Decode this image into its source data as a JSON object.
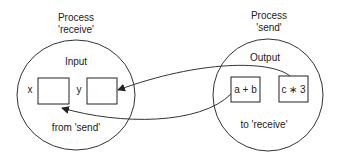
{
  "receive": {
    "title_line1": "Process",
    "title_line2": "'receive'",
    "section_label": "Input",
    "var_x": "x",
    "var_y": "y",
    "footer": "from 'send'"
  },
  "send": {
    "title_line1": "Process",
    "title_line2": "'send'",
    "section_label": "Output",
    "expr1": "a + b",
    "expr2": "c ∗ 3",
    "footer": "to 'receive'"
  }
}
